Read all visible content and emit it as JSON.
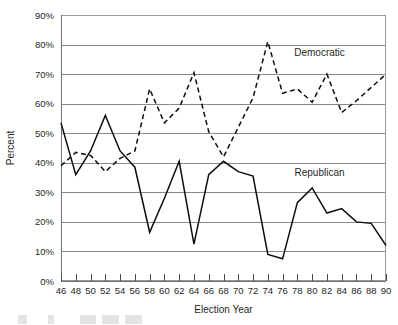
{
  "chart_data": {
    "type": "line",
    "title": "",
    "xlabel": "Election Year",
    "ylabel": "Percent",
    "x": [
      46,
      48,
      50,
      52,
      54,
      56,
      58,
      60,
      62,
      64,
      66,
      68,
      70,
      72,
      74,
      76,
      78,
      80,
      82,
      84,
      86,
      88,
      90
    ],
    "tick_labels_x": [
      "46",
      "48",
      "50",
      "52",
      "54",
      "56",
      "58",
      "60",
      "62",
      "64",
      "66",
      "68",
      "70",
      "72",
      "74",
      "76",
      "78",
      "80",
      "82",
      "84",
      "86",
      "88",
      "90"
    ],
    "tick_labels_y": [
      "0%",
      "10%",
      "20%",
      "30%",
      "40%",
      "50%",
      "60%",
      "70%",
      "80%",
      "90%"
    ],
    "ylim": [
      0,
      90
    ],
    "xlim": [
      46,
      90
    ],
    "y_tick_step": 10,
    "grid": true,
    "grid_axis": "y",
    "legend_position": "inline-annotation",
    "series": [
      {
        "name": "Democratic",
        "style": "dashed",
        "color": "#0d0d0d",
        "label_text": "Democratic",
        "values": [
          39,
          43.5,
          42.5,
          37,
          41.5,
          44,
          65,
          53.5,
          58.5,
          70.5,
          50.5,
          42,
          52,
          62,
          81,
          63.5,
          65,
          60.5,
          70,
          57,
          61,
          65.5,
          70
        ]
      },
      {
        "name": "Republican",
        "style": "solid",
        "color": "#0d0d0d",
        "label_text": "Republican",
        "values": [
          53.5,
          36,
          44,
          56,
          44,
          38.5,
          16.5,
          28,
          40.5,
          12.5,
          36,
          40.5,
          37,
          35.5,
          9,
          7.5,
          26.5,
          31.5,
          23,
          24.5,
          20,
          19.5,
          12
        ]
      }
    ],
    "annotations": [
      {
        "text": "Democratic",
        "x_value": 81,
        "y_value": 76,
        "name": "democratic-series-label"
      },
      {
        "text": "Republican",
        "x_value": 81,
        "y_value": 35.5,
        "name": "republican-series-label"
      }
    ]
  }
}
